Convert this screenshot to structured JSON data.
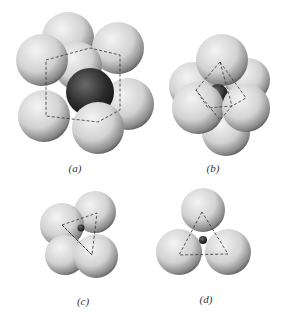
{
  "figure": {
    "panels": [
      {
        "id": "a",
        "label": "(a)",
        "description": "central dark sphere surrounded by 8 spheres at cube corners",
        "label_pos": [
          75,
          170
        ]
      },
      {
        "id": "b",
        "label": "(b)",
        "description": "central sphere surrounded by 6 spheres, octahedral arrangement",
        "label_pos": [
          213,
          170
        ]
      },
      {
        "id": "c",
        "label": "(c)",
        "description": "small central sphere among 4 spheres, tetrahedral arrangement",
        "label_pos": [
          83,
          302
        ]
      },
      {
        "id": "d",
        "label": "(d)",
        "description": "small central sphere among 3 spheres, triangular arrangement",
        "label_pos": [
          206,
          300
        ]
      }
    ]
  }
}
